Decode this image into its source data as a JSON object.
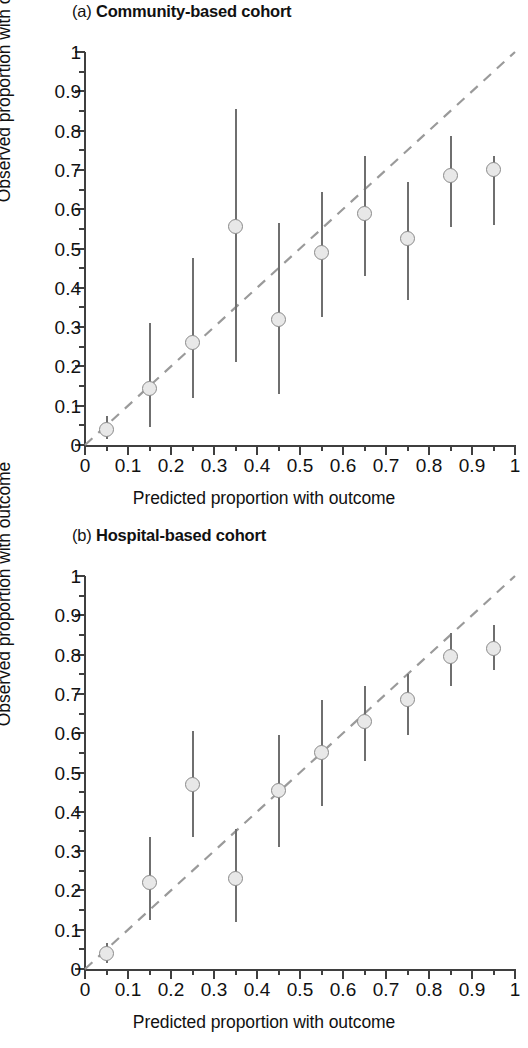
{
  "figure": {
    "panels": [
      {
        "id": "a",
        "tag": "(a)",
        "name": "Community-based cohort",
        "title_full": "(a) Community-based cohort"
      },
      {
        "id": "b",
        "tag": "(b)",
        "name": "Hospital-based cohort",
        "title_full": "(b) Hospital-based cohort"
      }
    ],
    "axis_titles": {
      "x": "Predicted proportion with outcome",
      "y": "Observed proportion with outcome"
    },
    "tick_labels": [
      "0",
      "0.1",
      "0.2",
      "0.3",
      "0.4",
      "0.5",
      "0.6",
      "0.7",
      "0.8",
      "0.9",
      "1"
    ],
    "colors": {
      "axis": "#3f3f3f",
      "marker_fill": "#e8e8e8",
      "marker_edge": "#8a8a8a",
      "errorbar": "#6f6f6f",
      "refline": "#9a9a9a",
      "text": "#111111",
      "background": "#ffffff"
    }
  },
  "chart_data": [
    {
      "type": "scatter",
      "panel": "a",
      "title": "(a) Community-based cohort",
      "xlabel": "Predicted proportion with outcome",
      "ylabel": "Observed proportion with outcome",
      "xlim": [
        0,
        1
      ],
      "ylim": [
        0,
        1
      ],
      "xticks": [
        0,
        0.1,
        0.2,
        0.3,
        0.4,
        0.5,
        0.6,
        0.7,
        0.8,
        0.9,
        1
      ],
      "yticks": [
        0,
        0.1,
        0.2,
        0.3,
        0.4,
        0.5,
        0.6,
        0.7,
        0.8,
        0.9,
        1
      ],
      "minor_tick_step": 0.05,
      "grid": false,
      "legend": "none",
      "reference_line": {
        "label": "identity line",
        "style": "dashed",
        "from": [
          0,
          0
        ],
        "to": [
          1,
          1
        ]
      },
      "x": [
        0.05,
        0.15,
        0.25,
        0.35,
        0.45,
        0.55,
        0.65,
        0.75,
        0.85,
        0.95
      ],
      "y": [
        0.04,
        0.145,
        0.26,
        0.555,
        0.32,
        0.49,
        0.59,
        0.525,
        0.685,
        0.7
      ],
      "ci_low": [
        0.015,
        0.045,
        0.12,
        0.21,
        0.13,
        0.325,
        0.43,
        0.37,
        0.555,
        0.56
      ],
      "ci_high": [
        0.075,
        0.31,
        0.475,
        0.855,
        0.565,
        0.645,
        0.735,
        0.67,
        0.785,
        0.735
      ]
    },
    {
      "type": "scatter",
      "panel": "b",
      "title": "(b) Hospital-based cohort",
      "xlabel": "Predicted proportion with outcome",
      "ylabel": "Observed proportion with outcome",
      "xlim": [
        0,
        1
      ],
      "ylim": [
        0,
        1
      ],
      "xticks": [
        0,
        0.1,
        0.2,
        0.3,
        0.4,
        0.5,
        0.6,
        0.7,
        0.8,
        0.9,
        1
      ],
      "yticks": [
        0,
        0.1,
        0.2,
        0.3,
        0.4,
        0.5,
        0.6,
        0.7,
        0.8,
        0.9,
        1
      ],
      "minor_tick_step": 0.05,
      "grid": false,
      "legend": "none",
      "reference_line": {
        "label": "identity line",
        "style": "dashed",
        "from": [
          0,
          0
        ],
        "to": [
          1,
          1
        ]
      },
      "x": [
        0.05,
        0.15,
        0.25,
        0.35,
        0.45,
        0.55,
        0.65,
        0.75,
        0.85,
        0.95
      ],
      "y": [
        0.04,
        0.22,
        0.47,
        0.23,
        0.455,
        0.55,
        0.63,
        0.685,
        0.795,
        0.815
      ],
      "ci_low": [
        0.015,
        0.125,
        0.335,
        0.12,
        0.31,
        0.415,
        0.53,
        0.595,
        0.72,
        0.76
      ],
      "ci_high": [
        0.065,
        0.335,
        0.605,
        0.355,
        0.595,
        0.685,
        0.72,
        0.75,
        0.855,
        0.875
      ]
    }
  ]
}
